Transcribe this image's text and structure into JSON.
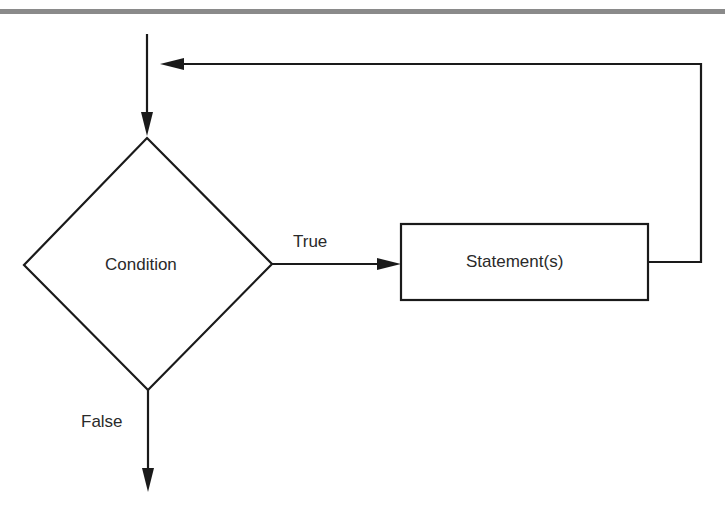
{
  "diagram": {
    "type": "flowchart-while-loop",
    "nodes": [
      {
        "id": "condition",
        "shape": "diamond",
        "label": "Condition"
      },
      {
        "id": "statements",
        "shape": "rectangle",
        "label": "Statement(s)"
      }
    ],
    "edges": [
      {
        "from": "entry",
        "to": "condition",
        "label": ""
      },
      {
        "from": "condition",
        "to": "statements",
        "label": "True"
      },
      {
        "from": "statements",
        "to": "condition",
        "label": ""
      },
      {
        "from": "condition",
        "to": "exit",
        "label": "False"
      }
    ],
    "labels": {
      "condition": "Condition",
      "statements": "Statement(s)",
      "true_edge": "True",
      "false_edge": "False"
    },
    "colors": {
      "stroke": "#1a1a1a",
      "text": "#2a2a2a",
      "top_bar": "#8a8a8a"
    }
  }
}
